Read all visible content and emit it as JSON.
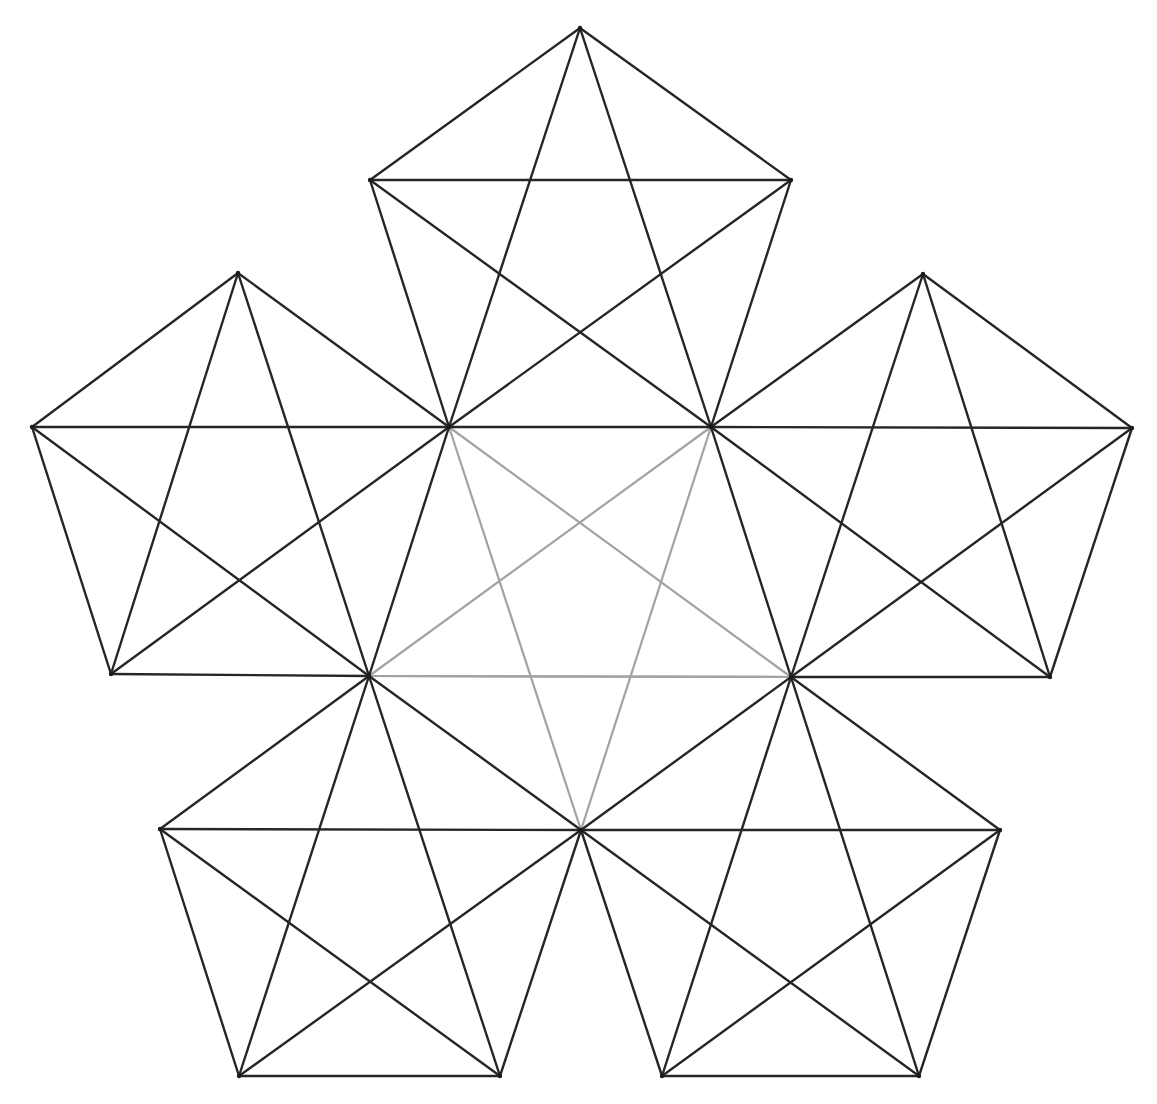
{
  "figure": {
    "caption_fragment": "",
    "colors": {
      "background": "#ffffff",
      "outer_lines": "#262626",
      "central_star_lines": "#a3a3a3"
    },
    "central_pentagon": {
      "name": "center",
      "vertices": [
        [
          449,
          427
        ],
        [
          711,
          427
        ],
        [
          791,
          677
        ],
        [
          581,
          830
        ],
        [
          369,
          676
        ]
      ],
      "highlighted_edges": [
        [
          [
            369,
            676
          ],
          [
            791,
            677
          ]
        ]
      ],
      "diagonals_color": "light"
    },
    "outer_pentagons": [
      {
        "name": "top",
        "vertices": [
          [
            449,
            427
          ],
          [
            711,
            427
          ],
          [
            791,
            180
          ],
          [
            580,
            28
          ],
          [
            370,
            180
          ]
        ]
      },
      {
        "name": "left",
        "vertices": [
          [
            449,
            427
          ],
          [
            369,
            676
          ],
          [
            111,
            674
          ],
          [
            32,
            427
          ],
          [
            238,
            273
          ]
        ]
      },
      {
        "name": "right",
        "vertices": [
          [
            711,
            427
          ],
          [
            791,
            677
          ],
          [
            1050,
            677
          ],
          [
            1132,
            428
          ],
          [
            923,
            274
          ]
        ]
      },
      {
        "name": "bottom-left",
        "vertices": [
          [
            369,
            676
          ],
          [
            581,
            830
          ],
          [
            500,
            1076
          ],
          [
            239,
            1076
          ],
          [
            160,
            829
          ]
        ]
      },
      {
        "name": "bottom-right",
        "vertices": [
          [
            581,
            830
          ],
          [
            791,
            677
          ],
          [
            1000,
            830
          ],
          [
            919,
            1076
          ],
          [
            662,
            1076
          ]
        ]
      }
    ]
  }
}
